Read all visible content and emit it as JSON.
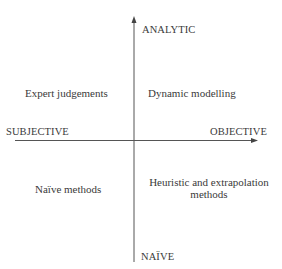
{
  "diagram": {
    "axes": {
      "top": "ANALYTIC",
      "bottom": "NAÏVE",
      "left": "SUBJECTIVE",
      "right": "OBJECTIVE"
    },
    "quadrants": {
      "top_left": "Expert judgements",
      "top_right": "Dynamic modelling",
      "bottom_left": "Naïve methods",
      "bottom_right_line1": "Heuristic and extrapolation",
      "bottom_right_line2": "methods"
    },
    "colors": {
      "line": "#555555",
      "text": "#3a3a3a"
    }
  }
}
